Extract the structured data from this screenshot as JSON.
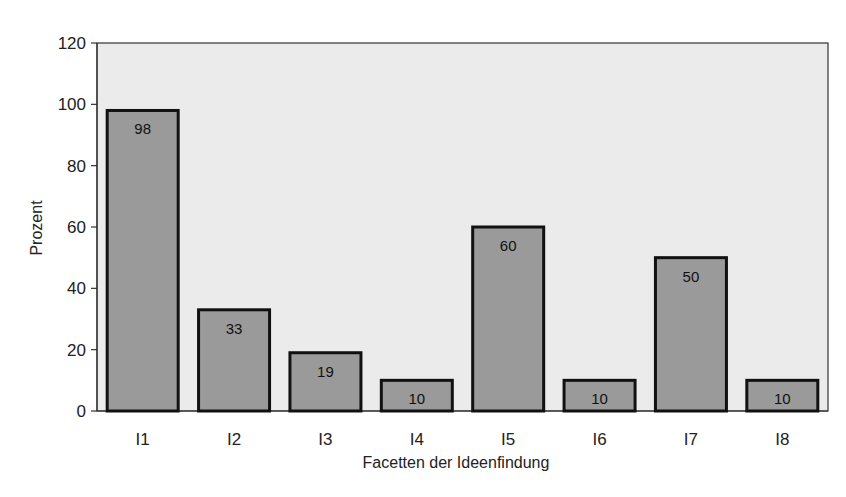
{
  "chart_data": {
    "type": "bar",
    "title": "",
    "xlabel": "Facetten der Ideenfindung",
    "ylabel": "Prozent",
    "categories": [
      "I1",
      "I2",
      "I3",
      "I4",
      "I5",
      "I6",
      "I7",
      "I8"
    ],
    "values": [
      98,
      33,
      19,
      10,
      60,
      10,
      50,
      10
    ],
    "data_labels": [
      "98",
      "33",
      "19",
      "10",
      "60",
      "10",
      "50",
      "10"
    ],
    "ylim": [
      0,
      120
    ],
    "yticks": [
      0,
      20,
      40,
      60,
      80,
      100,
      120
    ],
    "grid": false,
    "legend": null,
    "colors": {
      "bar_fill": "#9a9a9a",
      "bar_stroke": "#111111",
      "plot_background": "#ebebeb"
    }
  }
}
